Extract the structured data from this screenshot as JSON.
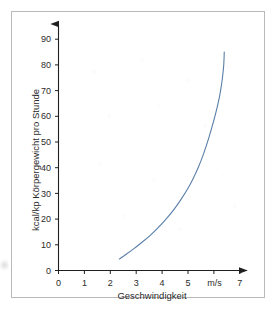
{
  "figure": {
    "frame_color": "#b9b9bb",
    "background_color": "#ffffff"
  },
  "chart_data": {
    "type": "line",
    "title": "",
    "subtitle": "",
    "xlabel": "Geschwindigkeit",
    "ylabel": "kcal/kp Körpergewicht pro Stunde",
    "x_unit": "m/s",
    "xlim": [
      0,
      7.4
    ],
    "ylim": [
      0,
      93
    ],
    "xticks": [
      0,
      1,
      2,
      3,
      4,
      5,
      6,
      7
    ],
    "xtick_labels": [
      "0",
      "1",
      "2",
      "3",
      "4",
      "5",
      "m/s",
      "7"
    ],
    "yticks": [
      0,
      10,
      20,
      30,
      40,
      50,
      60,
      70,
      80,
      90
    ],
    "ytick_labels": [
      "0",
      "10",
      "20",
      "30",
      "40",
      "50",
      "60",
      "70",
      "80",
      "90"
    ],
    "grid": false,
    "legend": false,
    "legend_position": "none",
    "axis_arrows": true,
    "series": [
      {
        "name": "Energieverbrauch",
        "color": "#5a7fa8",
        "line_width": 1.1,
        "points": [
          [
            2.35,
            4.5
          ],
          [
            2.6,
            6.2
          ],
          [
            2.9,
            8.4
          ],
          [
            3.2,
            10.8
          ],
          [
            3.5,
            13.3
          ],
          [
            3.8,
            16.2
          ],
          [
            4.1,
            19.4
          ],
          [
            4.4,
            23.0
          ],
          [
            4.7,
            27.2
          ],
          [
            5.0,
            32.0
          ],
          [
            5.2,
            35.8
          ],
          [
            5.4,
            40.2
          ],
          [
            5.6,
            45.4
          ],
          [
            5.8,
            51.5
          ],
          [
            6.0,
            58.5
          ],
          [
            6.15,
            64.5
          ],
          [
            6.25,
            69.5
          ],
          [
            6.33,
            75.0
          ],
          [
            6.38,
            80.0
          ],
          [
            6.4,
            85.0
          ]
        ]
      }
    ],
    "annotations": []
  },
  "axes": {
    "x_tick_0": "0",
    "x_tick_1": "1",
    "x_tick_2": "2",
    "x_tick_3": "3",
    "x_tick_4": "4",
    "x_tick_5": "5",
    "x_tick_6": "m/s",
    "x_tick_7": "7",
    "y_tick_0": "0",
    "y_tick_10": "10",
    "y_tick_20": "20",
    "y_tick_30": "30",
    "y_tick_40": "40",
    "y_tick_50": "50",
    "y_tick_60": "60",
    "y_tick_70": "70",
    "y_tick_80": "80",
    "y_tick_90": "90"
  }
}
